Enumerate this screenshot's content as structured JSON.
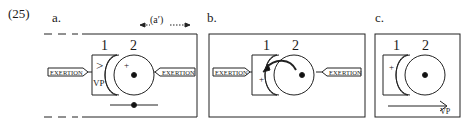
{
  "example_number": "(25)",
  "panels": [
    {
      "label": "a.",
      "span_annotation": "(a′)",
      "block_1": "1",
      "block_2": "2",
      "block_1_symbol": ">",
      "block_1_sub": "VP",
      "block_2_symbol": "+",
      "left_force": "EXERTION",
      "right_force": "EXERTION"
    },
    {
      "label": "b.",
      "block_1": "1",
      "block_2": "2",
      "block_1_symbol": "+",
      "left_force": "EXERTION",
      "right_force": "EXERTION"
    },
    {
      "label": "c.",
      "block_1": "1",
      "block_2": "2",
      "block_1_symbol": "+",
      "arrow_label": "VP"
    }
  ]
}
